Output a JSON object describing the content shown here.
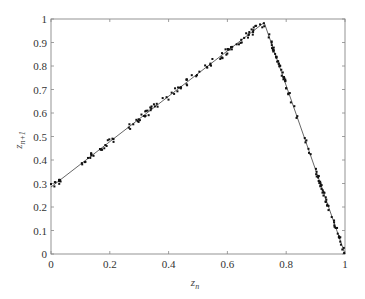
{
  "chart_data": {
    "type": "scatter",
    "title": "",
    "xlabel": "z_n",
    "ylabel": "z_{n+1}",
    "xlim": [
      0,
      1
    ],
    "ylim": [
      0,
      1
    ],
    "grid": false,
    "legend": null,
    "x_ticks": [
      "0",
      "0.2",
      "0.4",
      "0.6",
      "0.8",
      "1"
    ],
    "y_ticks": [
      "0",
      "0.1",
      "0.2",
      "0.3",
      "0.4",
      "0.5",
      "0.6",
      "0.7",
      "0.8",
      "0.9",
      "1"
    ],
    "fit_line": {
      "name": "piecewise linear map",
      "points": [
        [
          0,
          0.285
        ],
        [
          0.725,
          0.985
        ],
        [
          1.0,
          0.0
        ]
      ]
    },
    "series": [
      {
        "name": "data points",
        "description": "return-map samples scattered closely along the piecewise linear fit",
        "clusters": [
          {
            "x_from": 0.0,
            "x_to": 0.04,
            "count": 10
          },
          {
            "x_from": 0.1,
            "x_to": 0.14,
            "count": 10
          },
          {
            "x_from": 0.14,
            "x_to": 0.22,
            "count": 14
          },
          {
            "x_from": 0.26,
            "x_to": 0.32,
            "count": 12
          },
          {
            "x_from": 0.32,
            "x_to": 0.48,
            "count": 30
          },
          {
            "x_from": 0.48,
            "x_to": 0.55,
            "count": 10
          },
          {
            "x_from": 0.57,
            "x_to": 0.725,
            "count": 36
          },
          {
            "x_from": 0.725,
            "x_to": 0.8,
            "count": 34
          },
          {
            "x_from": 0.8,
            "x_to": 0.84,
            "count": 8
          },
          {
            "x_from": 0.86,
            "x_to": 0.93,
            "count": 26
          },
          {
            "x_from": 0.93,
            "x_to": 1.0,
            "count": 26
          }
        ]
      }
    ]
  },
  "colors": {
    "axis": "#888888",
    "line": "#555555",
    "points": "#111111",
    "background": "#ffffff"
  }
}
